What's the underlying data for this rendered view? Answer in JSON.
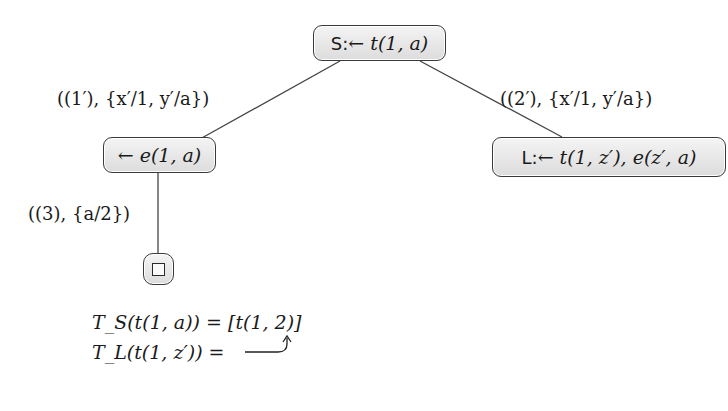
{
  "diagram": {
    "type": "sld-resolution-tree",
    "nodes": [
      {
        "id": "root",
        "tag": "S:",
        "clause": "← t(1, a)"
      },
      {
        "id": "left",
        "tag": "",
        "clause": "← e(1, a)"
      },
      {
        "id": "right",
        "tag": "L:",
        "clause": "← t(1, z′), e(z′, a)"
      },
      {
        "id": "empty",
        "tag": "",
        "clause": "□"
      }
    ],
    "edges": [
      {
        "from": "root",
        "to": "left",
        "label": "((1′), {x′/1, y′/a})"
      },
      {
        "from": "root",
        "to": "right",
        "label": "((2′), {x′/1, y′/a})"
      },
      {
        "from": "left",
        "to": "empty",
        "label": "((3), {a/2})"
      }
    ],
    "tables": [
      {
        "lhs": "T_S(t(1, a)) = ",
        "rhs": "[t(1, 2)]"
      },
      {
        "lhs": "T_L(t(1, z′)) = ",
        "rhs": "↩ (points to T_S entry)"
      }
    ]
  },
  "colors": {
    "node_fill_top": "#f4f4f4",
    "node_fill_bottom": "#dcdcdc",
    "border": "#3a3a3a",
    "line": "#444444"
  }
}
